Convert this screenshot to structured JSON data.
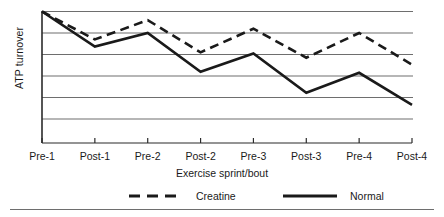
{
  "figure": {
    "background_color": "#ffffff",
    "line_color": "#1a1a1a",
    "grid_color": "#6e6e6e"
  },
  "axis": {
    "ylabel": "ATP turnover",
    "xlabel": "Exercise sprint/bout"
  },
  "legend": {
    "items": [
      {
        "label": "Creatine",
        "style": "dashed",
        "icon": "dashed-line-icon"
      },
      {
        "label": "Normal",
        "style": "solid",
        "icon": "solid-line-icon"
      }
    ]
  },
  "chart_data": {
    "type": "line",
    "title": "",
    "subtitle": "",
    "xlabel": "Exercise sprint/bout",
    "ylabel": "ATP turnover",
    "categories": [
      "Pre-1",
      "Post-1",
      "Pre-2",
      "Post-2",
      "Pre-3",
      "Post-3",
      "Pre-4",
      "Post-4"
    ],
    "ylim": [
      0,
      5
    ],
    "yticks": [
      0,
      1,
      2,
      3,
      4,
      5
    ],
    "ytick_labels": [
      "",
      "",
      "",
      "",
      "",
      ""
    ],
    "grid": "horizontal",
    "legend_position": "below-axes",
    "series": [
      {
        "name": "Creatine",
        "style": "dashed",
        "color": "#1a1a1a",
        "values": [
          5.0,
          3.7,
          4.6,
          3.1,
          4.2,
          2.85,
          4.0,
          2.53
        ]
      },
      {
        "name": "Normal",
        "style": "solid",
        "color": "#1a1a1a",
        "values": [
          5.0,
          3.37,
          4.0,
          2.2,
          3.05,
          1.22,
          2.15,
          0.66
        ]
      }
    ]
  }
}
